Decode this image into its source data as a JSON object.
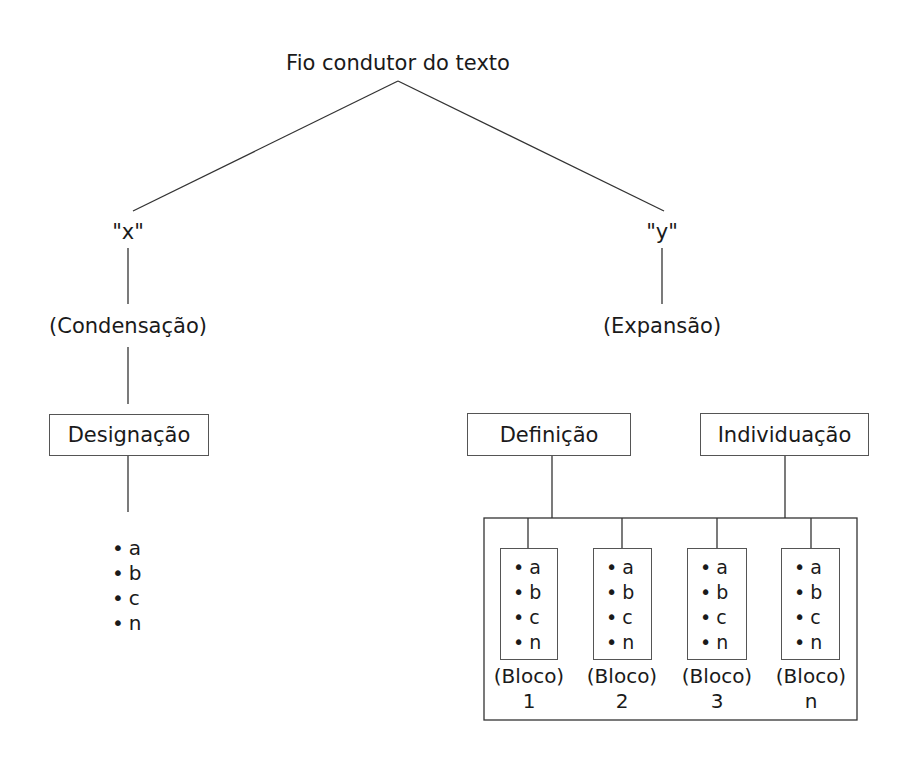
{
  "title": "Fio condutor do texto",
  "left": {
    "var_label": "\"x\"",
    "process": "(Condensação)",
    "box": "Designação",
    "items": [
      "a",
      "b",
      "c",
      "n"
    ]
  },
  "right": {
    "var_label": "\"y\"",
    "process": "(Expansão)",
    "boxes": [
      "Definição",
      "Individuação"
    ],
    "blocks": [
      {
        "items": [
          "a",
          "b",
          "c",
          "n"
        ],
        "caption": "(Bloco)",
        "number": "1"
      },
      {
        "items": [
          "a",
          "b",
          "c",
          "n"
        ],
        "caption": "(Bloco)",
        "number": "2"
      },
      {
        "items": [
          "a",
          "b",
          "c",
          "n"
        ],
        "caption": "(Bloco)",
        "number": "3"
      },
      {
        "items": [
          "a",
          "b",
          "c",
          "n"
        ],
        "caption": "(Bloco)",
        "number": "n"
      }
    ]
  }
}
